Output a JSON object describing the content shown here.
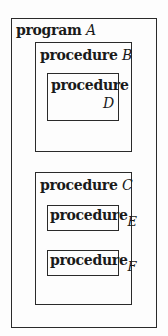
{
  "diagram": {
    "type": "nested-scope-blocks",
    "program": {
      "keyword": "program",
      "name": "A",
      "procedures": [
        {
          "keyword": "procedure",
          "name": "B",
          "procedures": [
            {
              "keyword": "procedure",
              "name": "D"
            }
          ]
        },
        {
          "keyword": "procedure",
          "name": "C",
          "procedures": [
            {
              "keyword": "procedure",
              "name": "E"
            },
            {
              "keyword": "procedure",
              "name": "F"
            }
          ]
        }
      ]
    }
  }
}
